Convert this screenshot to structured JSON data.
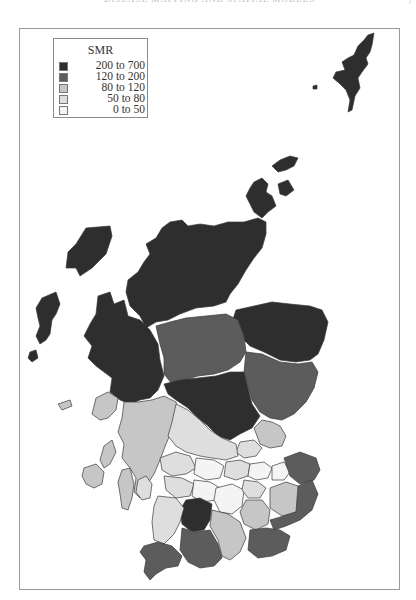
{
  "page": {
    "running_header": "DISEASE MAPPING AND SPATIAL MODELS",
    "page_number": "7"
  },
  "legend": {
    "title": "SMR",
    "classes": [
      {
        "label": "200 to 700",
        "color": "#2e2e2e"
      },
      {
        "label": "120 to 200",
        "color": "#5c5c5c"
      },
      {
        "label": "80 to 120",
        "color": "#c6c6c6"
      },
      {
        "label": "50 to 80",
        "color": "#dedede"
      },
      {
        "label": "0 to 50",
        "color": "#f4f4f4"
      }
    ]
  },
  "map": {
    "subject": "Scotland districts",
    "variable": "SMR",
    "regions": [
      {
        "name": "Shetland",
        "class": 0
      },
      {
        "name": "Orkney",
        "class": 0
      },
      {
        "name": "Western Isles",
        "class": 0
      },
      {
        "name": "Highland (Caithness/Sutherland/Ross)",
        "class": 0
      },
      {
        "name": "Skye & Lochalsh / Lochaber",
        "class": 0
      },
      {
        "name": "Moray / Banff & Buchan / Gordon",
        "class": 0
      },
      {
        "name": "Badenoch & Strathspey",
        "class": 1
      },
      {
        "name": "Kincardine & Deeside / Angus",
        "class": 1
      },
      {
        "name": "Perth & Kinross (north)",
        "class": 0
      },
      {
        "name": "Argyll & Bute",
        "class": 2
      },
      {
        "name": "Mull / Islay / Jura",
        "class": 2
      },
      {
        "name": "Stirling / Central",
        "class": 3
      },
      {
        "name": "Dundee / Fife",
        "class": 2
      },
      {
        "name": "Clydeside districts",
        "class": 3
      },
      {
        "name": "Lothian districts",
        "class": 4
      },
      {
        "name": "Ettrick & Lauderdale / Tweeddale",
        "class": 2
      },
      {
        "name": "Berwickshire / Roxburgh",
        "class": 1
      },
      {
        "name": "Cumnock & Doon Valley",
        "class": 0
      },
      {
        "name": "Kyle & Carrick",
        "class": 3
      },
      {
        "name": "Nithsdale",
        "class": 1
      },
      {
        "name": "Annandale & Eskdale",
        "class": 2
      },
      {
        "name": "Wigtown / Stewartry",
        "class": 1
      },
      {
        "name": "Arran",
        "class": 3
      }
    ]
  }
}
